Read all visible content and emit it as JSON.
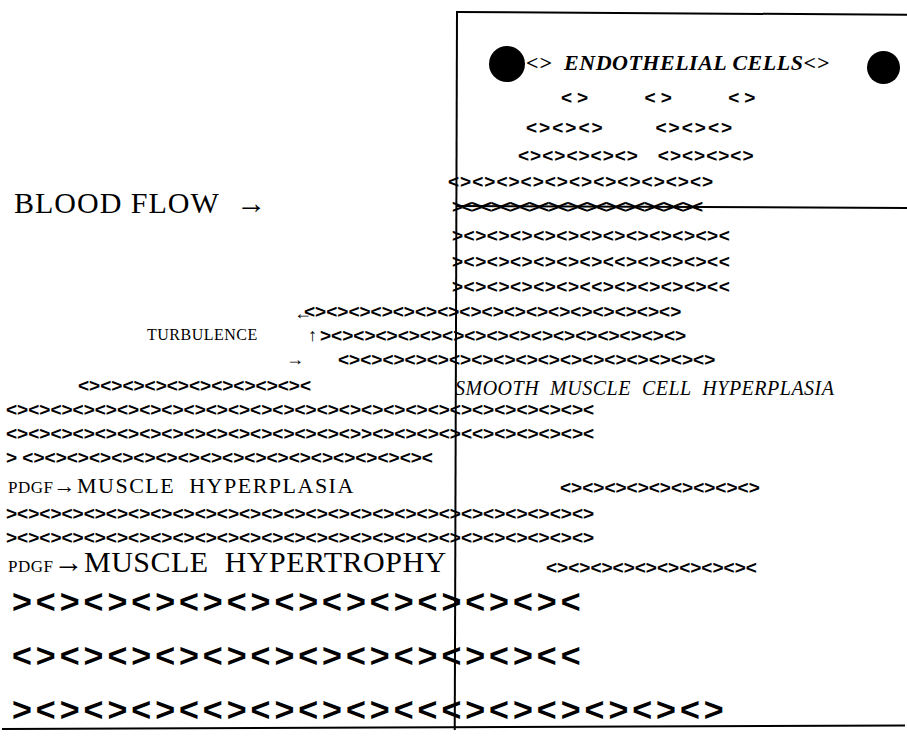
{
  "diagram": {
    "colors": {
      "ink": "#000000",
      "paper": "#ffffff"
    },
    "glyph": "<>"
  },
  "labels": {
    "blood_flow": "BLOOD FLOW  →",
    "turbulence": "TURBULENCE",
    "endothelial_cells": "<>  ENDOTHELIAL CELLS<>",
    "smooth_muscle_cell_hyperplasia": "SMOOTH  MUSCLE  CELL  HYPERPLASIA",
    "pdgf_hyperplasia_prefix": "PDGF",
    "pdgf_hyperplasia_arrow": "→",
    "pdgf_hyperplasia_text": "MUSCLE  HYPERPLASIA",
    "pdgf_hypertrophy_prefix": "PDGF",
    "pdgf_hypertrophy_arrow": "→",
    "pdgf_hypertrophy_text": "MUSCLE  HYPERTROPHY"
  },
  "arrows": {
    "blood_flow_arrow": "→",
    "turbulence_left_arrow": "←",
    "turbulence_up_arrow": "↑",
    "turbulence_right_arrow": "→"
  },
  "lumen_cells": [
    {
      "name": "blood-cell-left",
      "shape": "filled-circle"
    },
    {
      "name": "blood-cell-right",
      "shape": "filled-circle"
    }
  ],
  "cell_rows": [
    {
      "id": "r1",
      "left": 561,
      "top": 88,
      "size": 19,
      "spacing": 5.0,
      "text": "<>     <>     <>"
    },
    {
      "id": "r2",
      "left": 526,
      "top": 118,
      "size": 19,
      "spacing": 2.0,
      "text": "<><><>       <><><>"
    },
    {
      "id": "r3",
      "left": 518,
      "top": 146,
      "size": 19,
      "spacing": 1.0,
      "text": "<><><><><>   <><><><>"
    },
    {
      "id": "r4",
      "left": 448,
      "top": 172,
      "size": 19,
      "spacing": 1.0,
      "text": "<><><><><><><><><><><>"
    },
    {
      "id": "r5",
      "left": 452,
      "top": 197,
      "size": 19,
      "spacing": -1.5,
      "text": "><><><><><><><><><><><><><"
    },
    {
      "id": "r6",
      "left": 452,
      "top": 226,
      "size": 19,
      "spacing": 0.5,
      "text": "><><><><><><><><><><><><"
    },
    {
      "id": "r7",
      "left": 452,
      "top": 252,
      "size": 19,
      "spacing": 0.5,
      "text": "><><><><><><><<><><><><<"
    },
    {
      "id": "r8",
      "left": 452,
      "top": 277,
      "size": 19,
      "spacing": 0.5,
      "text": "><><><><><><<><><><><><<"
    },
    {
      "id": "r9",
      "left": 304,
      "top": 302,
      "size": 19,
      "spacing": 0.0,
      "text": "<><><><><><><><><><><><><><><><><>"
    },
    {
      "id": "r10",
      "left": 320,
      "top": 326,
      "size": 19,
      "spacing": 0.0,
      "text": "><><><><><><><><><><><><><><><><>"
    },
    {
      "id": "r11",
      "left": 338,
      "top": 350,
      "size": 19,
      "spacing": 0.0,
      "text": "<><><><><><><><><><><><><><><><><>"
    },
    {
      "id": "r12",
      "left": 78,
      "top": 376,
      "size": 19,
      "spacing": 0.0,
      "text": "<><><><><><><><><><><"
    },
    {
      "id": "r13",
      "left": 6,
      "top": 400,
      "size": 19,
      "spacing": 0.0,
      "text": "<><><><><><><><><><><><><><><><><><><><><><><><><><><"
    },
    {
      "id": "r14",
      "left": 6,
      "top": 424,
      "size": 19,
      "spacing": 0.0,
      "text": "<><><><><><><><><><><><><><><><>><><><><><<><><><><><"
    },
    {
      "id": "r15",
      "left": 6,
      "top": 448,
      "size": 19,
      "spacing": 0.0,
      "text": "> <><><><><><><><><><><><><><><><><><><"
    },
    {
      "id": "r16",
      "left": 560,
      "top": 478,
      "size": 19,
      "spacing": 0.0,
      "text": "<><><><><><><><><>"
    },
    {
      "id": "r17",
      "left": 6,
      "top": 504,
      "size": 19,
      "spacing": 0.0,
      "text": "><><><><><><><><><><><><><><><><><><><><><><><><><><>"
    },
    {
      "id": "r18",
      "left": 6,
      "top": 528,
      "size": 19,
      "spacing": 0.0,
      "text": "><><><><><><><><><><><><><><><><><><><><><><><><><><>"
    },
    {
      "id": "r19",
      "left": 546,
      "top": 558,
      "size": 19,
      "spacing": 0.0,
      "text": "<><><><><><><><><><"
    },
    {
      "id": "r20",
      "left": 12,
      "top": 584,
      "size": 34,
      "spacing": 4.0,
      "text": "><><><><><><><><><><><><"
    },
    {
      "id": "r21",
      "left": 12,
      "top": 638,
      "size": 34,
      "spacing": 4.0,
      "text": "<><><><><><><><><><><><<"
    },
    {
      "id": "r22",
      "left": 12,
      "top": 692,
      "size": 34,
      "spacing": 4.0,
      "text": "><><><><<><><><><<<><><><><><>"
    }
  ]
}
